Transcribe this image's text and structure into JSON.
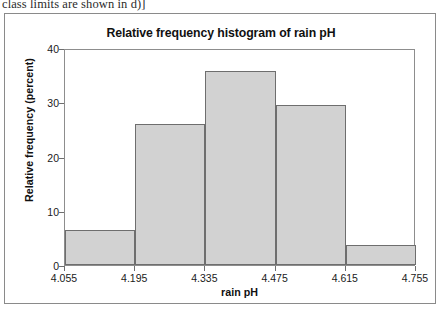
{
  "excerpt": {
    "text": "class limits are shown in d)]"
  },
  "figure": {
    "title": "Relative frequency histogram of rain pH"
  },
  "chart_data": {
    "type": "bar",
    "title": "Relative frequency histogram of rain pH",
    "xlabel": "rain pH",
    "ylabel": "Relative frequency (percent)",
    "xlim": [
      4.055,
      4.755
    ],
    "ylim": [
      0,
      40
    ],
    "grid": false,
    "legend": null,
    "xtick_labels": [
      "4.055",
      "4.195",
      "4.335",
      "4.475",
      "4.615",
      "4.755"
    ],
    "xtick_values": [
      4.055,
      4.195,
      4.335,
      4.475,
      4.615,
      4.755
    ],
    "ytick_labels": [
      "0",
      "10",
      "20",
      "30",
      "40"
    ],
    "ytick_values": [
      0,
      10,
      20,
      30,
      40
    ],
    "bin_width": 0.14,
    "bin_edges": [
      4.055,
      4.195,
      4.335,
      4.475,
      4.615,
      4.755
    ],
    "categories": [
      "4.055-4.195",
      "4.195-4.335",
      "4.335-4.475",
      "4.475-4.615",
      "4.615-4.755"
    ],
    "values": [
      6.5,
      26.0,
      35.8,
      29.5,
      3.7
    ],
    "bar_fill_color": "#d2d2d2",
    "bar_edge_color": "#6e6e6e"
  }
}
